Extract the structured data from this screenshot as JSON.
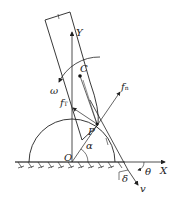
{
  "diagram": {
    "labels": {
      "Y": "Y",
      "X": "X",
      "O": "O",
      "C": "C",
      "P": "P",
      "omega": "ω",
      "f_tau": "f",
      "f_tau_sub": "T",
      "f_n": "f",
      "f_n_sub": "n",
      "alpha": "α",
      "delta": "δ",
      "theta": "θ",
      "v": "v"
    }
  }
}
